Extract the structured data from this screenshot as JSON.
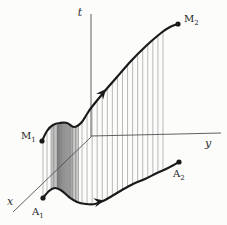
{
  "diagram": {
    "width": 227,
    "height": 225,
    "colors": {
      "background": "#fcfcfb",
      "axis": "#4f4f4f",
      "curve": "#1a1a1a",
      "label": "#1f1f1f"
    },
    "axes": [
      {
        "name": "t-axis",
        "label": "t",
        "x1": 91,
        "y1": 14,
        "x2": 91,
        "y2": 137,
        "label_x": 80,
        "label_y": 16
      },
      {
        "name": "y-axis",
        "label": "y",
        "x1": 91,
        "y1": 136,
        "x2": 221,
        "y2": 133,
        "label_x": 208,
        "label_y": 147
      },
      {
        "name": "x-axis",
        "label": "x",
        "x1": 91,
        "y1": 137,
        "x2": 13,
        "y2": 212,
        "label_x": 10,
        "label_y": 205
      }
    ],
    "curves": {
      "upper": {
        "name": "upper-trajectory-curve",
        "from": "M1",
        "to": "M2",
        "stroke_width": 2.2,
        "points": [
          [
            42,
            141
          ],
          [
            47,
            131
          ],
          [
            53,
            125
          ],
          [
            60,
            123
          ],
          [
            67,
            123
          ],
          [
            74,
            127
          ],
          [
            81,
            123
          ],
          [
            87,
            114
          ],
          [
            91,
            108
          ],
          [
            104,
            92
          ],
          [
            117,
            77
          ],
          [
            131,
            61
          ],
          [
            146,
            46
          ],
          [
            161,
            33
          ],
          [
            170,
            27
          ],
          [
            178,
            24
          ]
        ]
      },
      "lower": {
        "name": "lower-trajectory-curve",
        "from": "A1",
        "to": "A2",
        "stroke_width": 2.2,
        "points": [
          [
            43,
            198
          ],
          [
            49,
            191
          ],
          [
            55,
            188
          ],
          [
            62,
            191
          ],
          [
            69,
            197
          ],
          [
            77,
            202
          ],
          [
            86,
            204
          ],
          [
            95,
            204
          ],
          [
            103,
            201
          ],
          [
            112,
            196
          ],
          [
            122,
            190
          ],
          [
            133,
            184
          ],
          [
            145,
            179
          ],
          [
            157,
            173
          ],
          [
            168,
            168
          ],
          [
            179,
            162
          ]
        ]
      }
    },
    "hatch": {
      "description": "vertical ruling lines joining upper and lower curves",
      "bands": [
        {
          "name": "sparse-left",
          "x_start": 43,
          "x_end": 51,
          "step": 4.0,
          "color": "#9c9c9c",
          "width": 0.7
        },
        {
          "name": "dense-outer-left",
          "x_start": 52,
          "x_end": 57,
          "step": 1.4,
          "color": "#7c7c7c",
          "width": 0.8
        },
        {
          "name": "dense-core",
          "x_start": 57.5,
          "x_end": 72,
          "step": 1.05,
          "color": "#616161",
          "width": 0.85
        },
        {
          "name": "dense-outer-right",
          "x_start": 72.5,
          "x_end": 79.5,
          "step": 1.45,
          "color": "#7c7c7c",
          "width": 0.8
        },
        {
          "name": "sparse-right",
          "x_start": 82,
          "x_end": 168,
          "step": 5.06,
          "color": "#9c9c9c",
          "width": 0.7
        }
      ]
    },
    "arrows": [
      {
        "name": "upper-curve-direction-arrow",
        "x": 106,
        "y": 89,
        "angle": -50
      },
      {
        "name": "lower-curve-direction-arrow",
        "x": 104,
        "y": 200.5,
        "angle": -13
      }
    ],
    "markers": [
      {
        "name": "M1",
        "main": "M",
        "sub": "1",
        "dot": [
          42,
          141
        ],
        "label": [
          21,
          139
        ]
      },
      {
        "name": "M2",
        "main": "M",
        "sub": "2",
        "dot": [
          178,
          24
        ],
        "label": [
          184,
          22
        ]
      },
      {
        "name": "A1",
        "main": "A",
        "sub": "1",
        "dot": [
          43,
          198
        ],
        "label": [
          32,
          215
        ]
      },
      {
        "name": "A2",
        "main": "A",
        "sub": "2",
        "dot": [
          179,
          162
        ],
        "label": [
          173,
          177
        ]
      }
    ]
  }
}
